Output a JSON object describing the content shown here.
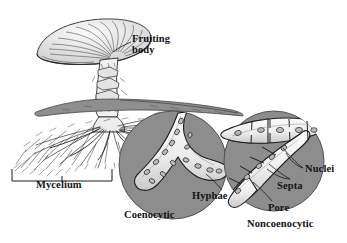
{
  "figure": {
    "domain": "biology-illustration",
    "background_color": "#ffffff",
    "ink_color": "#1a1a1a",
    "circle_fill_color": "#8d8d8d",
    "circle_stroke_color": "#555555",
    "hypha_fill_color": "#f4f4f4",
    "hypha_shade_color": "#d3d3d3",
    "nucleus_fill_color": "#b9b9b9",
    "soil_fill_color": "#9a9a9a",
    "cap_fill_color": "#e9e9e9"
  },
  "labels": {
    "fruiting_body_line1": "Fruiting",
    "fruiting_body_line2": "body",
    "mycelium": "Mycelium",
    "coenocytic": "Coenocytic",
    "hyphae": "Hyphae",
    "nuclei": "Nuclei",
    "septa": "Septa",
    "pore": "Pore",
    "noncoenocytic": "Noncoenocytic",
    "caption_partial": ""
  },
  "parts": {
    "mushroom": {
      "name": "mushroom-fruiting-body",
      "description": "Gilled mushroom with radially striate cap, annulus ring and scaly stalk"
    },
    "soil_line": {
      "name": "soil-surface",
      "description": "Dark gray ground surface band the stalk emerges through"
    },
    "mycelium_mass": {
      "name": "mycelium-threads",
      "description": "Dense fan of fine branching hyphal threads spreading below ground"
    },
    "bracket": {
      "name": "mycelium-bracket",
      "description": "Square bracket spanning the mycelium mass with a center tick"
    },
    "coenocytic_circle": {
      "name": "coenocytic-inset",
      "description": "Gray magnification circle showing a branched aseptate hypha with scattered oval nuclei"
    },
    "noncoenocytic_circle": {
      "name": "noncoenocytic-inset",
      "description": "Gray magnification circle showing septate hyphae divided into compartments by cross-walls, each with nuclei, and pores in the septa"
    }
  },
  "leader_lines": [
    {
      "name": "hyphae-leader",
      "from_label": "Hyphae",
      "points_to": "coenocytic hypha wall"
    },
    {
      "name": "nuclei-leader",
      "from_label": "Nuclei",
      "points_to": "two oval nuclei inside septate cells"
    },
    {
      "name": "septa-leader",
      "from_label": "Septa",
      "points_to": "two cross-walls between compartments"
    },
    {
      "name": "pore-leader",
      "from_label": "Pore",
      "points_to": "opening in a septum"
    },
    {
      "name": "fruiting-body-leader",
      "from_label": "Fruiting body",
      "points_to": "mushroom stalk"
    }
  ]
}
